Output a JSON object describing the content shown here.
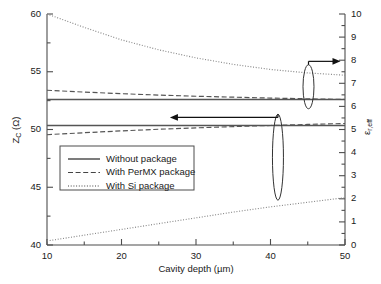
{
  "chart_data": {
    "type": "line",
    "title": "",
    "xlabel": "Cavity depth (µm)",
    "ylabel": "Z₁ (Ω)",
    "ylabel_main": "Z",
    "ylabel_sub": "C",
    "ylabel_unit": " (Ω)",
    "y2label": "ε",
    "y2label_sub": "r,eff",
    "xlim": [
      10,
      50
    ],
    "ylim": [
      40,
      60
    ],
    "y2lim": [
      0,
      10
    ],
    "xticks": [
      10,
      20,
      30,
      40,
      50
    ],
    "yticks": [
      40,
      45,
      50,
      55,
      60
    ],
    "y2ticks": [
      0,
      1,
      2,
      3,
      4,
      5,
      6,
      7,
      8,
      9,
      10
    ],
    "xtick_labels": [
      "10",
      "20",
      "30",
      "40",
      "50"
    ],
    "ytick_labels": [
      "40",
      "45",
      "50",
      "55",
      "60"
    ],
    "y2tick_labels": [
      "0",
      "1",
      "2",
      "3",
      "4",
      "5",
      "6",
      "7",
      "8",
      "9",
      "10"
    ],
    "x_minor_step": 5,
    "y_minor_step": 2.5,
    "y2_minor_step": 0.5,
    "grid": false,
    "legend_position": "center-left",
    "x": [
      10,
      15,
      20,
      25,
      30,
      35,
      40,
      45,
      50
    ],
    "series": [
      {
        "name": "Without package",
        "axis": "left",
        "style": "solid",
        "color": "#555555",
        "values": [
          50.35,
          50.35,
          50.35,
          50.35,
          50.35,
          50.35,
          50.35,
          50.35,
          50.35
        ]
      },
      {
        "name": "With PerMX package",
        "axis": "left",
        "style": "dashed",
        "color": "#555555",
        "values": [
          49.55,
          49.72,
          49.88,
          50.02,
          50.14,
          50.25,
          50.35,
          50.44,
          50.52
        ]
      },
      {
        "name": "With Si package",
        "axis": "left",
        "style": "dotted",
        "color": "#888888",
        "values": [
          40.35,
          40.85,
          41.35,
          41.85,
          42.35,
          42.85,
          43.3,
          43.7,
          44.1
        ]
      },
      {
        "name": "Without package",
        "axis": "right",
        "style": "solid",
        "color": "#555555",
        "values": [
          6.3,
          6.3,
          6.3,
          6.3,
          6.3,
          6.3,
          6.3,
          6.3,
          6.3
        ]
      },
      {
        "name": "With PerMX package",
        "axis": "right",
        "style": "dashed",
        "color": "#555555",
        "values": [
          6.7,
          6.62,
          6.55,
          6.49,
          6.44,
          6.4,
          6.36,
          6.33,
          6.3
        ]
      },
      {
        "name": "With Si package",
        "axis": "right",
        "style": "dotted",
        "color": "#888888",
        "values": [
          10.0,
          9.42,
          8.88,
          8.45,
          8.1,
          7.82,
          7.6,
          7.45,
          7.35
        ]
      }
    ],
    "annotations": [
      {
        "name": "left-axis-pointer",
        "type": "ellipse-with-arrow",
        "direction": "left",
        "ellipse_center_x": 41.0,
        "ellipse_center_y_left": 47.6,
        "arrow_from_x": 41.0,
        "arrow_to_x": 26.5,
        "arrow_y_left": 50.35
      },
      {
        "name": "right-axis-pointer",
        "type": "ellipse-with-arrow",
        "direction": "right",
        "ellipse_center_x": 45.1,
        "ellipse_center_y_right": 6.85,
        "arrow_from_x": 45.1,
        "arrow_to_x": 49.4,
        "arrow_y_right": 7.95
      }
    ],
    "legend": [
      {
        "label": "Without package",
        "style": "solid"
      },
      {
        "label": "With PerMX package",
        "style": "dashed"
      },
      {
        "label": "With Si package",
        "style": "dotted"
      }
    ]
  }
}
